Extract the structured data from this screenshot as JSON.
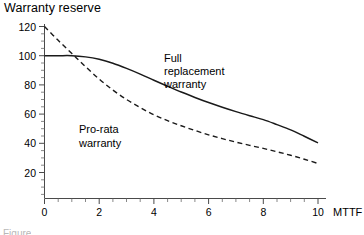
{
  "chart_data": {
    "type": "line",
    "title": "Warranty reserve",
    "xlabel": "MTTF",
    "ylabel": "",
    "xlim": [
      0,
      10.55
    ],
    "ylim": [
      0,
      125
    ],
    "grid": false,
    "legend": "inline-annotations",
    "x_ticks": [
      "0",
      "2",
      "4",
      "6",
      "8",
      "10"
    ],
    "x_tick_values": [
      0,
      2,
      4,
      6,
      8,
      10
    ],
    "x_minor_step": 0.5,
    "y_ticks": [
      "20",
      "40",
      "60",
      "80",
      "100",
      "120"
    ],
    "y_tick_values": [
      20,
      40,
      60,
      80,
      100,
      120
    ],
    "y_minor_step": 5,
    "series": [
      {
        "name": "Full replacement warranty",
        "style": "solid",
        "color": "#1a1a1a",
        "x": [
          0,
          0.5,
          1,
          1.5,
          2,
          2.5,
          3,
          3.5,
          4,
          4.5,
          5,
          5.5,
          6,
          6.5,
          7,
          7.5,
          8,
          8.5,
          9,
          9.5,
          10
        ],
        "values": [
          100,
          100,
          100,
          99.2,
          97.5,
          94.8,
          91.3,
          87.4,
          83.2,
          79.1,
          75.1,
          71.4,
          67.9,
          64.7,
          61.7,
          58.9,
          56.2,
          52.8,
          49.2,
          44.8,
          40.3
        ]
      },
      {
        "name": "Pro-rata warranty",
        "style": "dashed",
        "color": "#1a1a1a",
        "x": [
          0,
          0.5,
          1,
          1.5,
          2,
          2.5,
          3,
          3.5,
          4,
          4.5,
          5,
          5.5,
          6,
          6.5,
          7,
          7.5,
          8,
          8.5,
          9,
          9.5,
          10
        ],
        "values": [
          120,
          110.5,
          101.5,
          92.5,
          84.0,
          76.5,
          70.0,
          64.5,
          59.5,
          55.5,
          52.0,
          48.8,
          45.8,
          43.2,
          40.8,
          38.6,
          36.5,
          34.2,
          31.8,
          29.1,
          26.2
        ]
      }
    ],
    "annotations": [
      {
        "text_lines": [
          "Full",
          "replacement",
          "warranty"
        ],
        "x_data": 5.05,
        "y_data": 90,
        "name": "full-replacement-warranty-label"
      },
      {
        "text_lines": [
          "Pro-rata",
          "warranty"
        ],
        "x_data": 1.55,
        "y_data": 52,
        "name": "pro-rata-warranty-label"
      }
    ]
  },
  "caption": {
    "text": "Figure"
  }
}
